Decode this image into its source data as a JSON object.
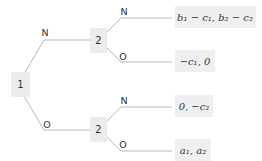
{
  "diagram": {
    "type": "game-tree",
    "root": {
      "player": "1",
      "branches": [
        {
          "action": "N",
          "node": {
            "player": "2",
            "branches": [
              {
                "action": "N",
                "payoff": "b₁ − c₁, b₂ − c₂"
              },
              {
                "action": "O",
                "payoff": "−c₁, 0"
              }
            ]
          }
        },
        {
          "action": "O",
          "node": {
            "player": "2",
            "branches": [
              {
                "action": "N",
                "payoff": "0, −c₂"
              },
              {
                "action": "O",
                "payoff": "a₁, a₂"
              }
            ]
          }
        }
      ]
    }
  }
}
